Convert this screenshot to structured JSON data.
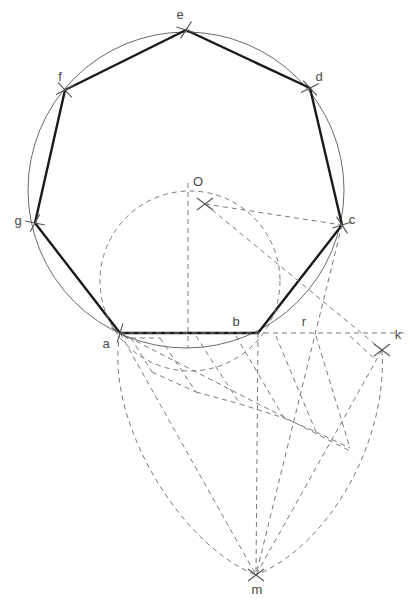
{
  "figure": {
    "background_color": "#ffffff",
    "colors": {
      "polygon_stroke": "#1a1a1a",
      "circle_stroke": "#6b6b6b",
      "construction_stroke": "#7a7a7a",
      "tick_stroke": "#555555",
      "label_fill": "#4a4a4a"
    }
  },
  "labels": [
    {
      "id": "label-a",
      "text": "a",
      "x": 106,
      "y": 345
    },
    {
      "id": "label-b",
      "text": "b",
      "x": 236,
      "y": 323
    },
    {
      "id": "label-c",
      "text": "c",
      "x": 352,
      "y": 221
    },
    {
      "id": "label-d",
      "text": "d",
      "x": 319,
      "y": 78
    },
    {
      "id": "label-e",
      "text": "e",
      "x": 180,
      "y": 16
    },
    {
      "id": "label-f",
      "text": "f",
      "x": 60,
      "y": 78
    },
    {
      "id": "label-g",
      "text": "g",
      "x": 18,
      "y": 222
    },
    {
      "id": "label-O",
      "text": "O",
      "x": 198,
      "y": 183
    },
    {
      "id": "label-r",
      "text": "r",
      "x": 304,
      "y": 323
    },
    {
      "id": "label-k",
      "text": "k",
      "x": 398,
      "y": 336
    },
    {
      "id": "label-m",
      "text": "m",
      "x": 257,
      "y": 591
    }
  ],
  "points": {
    "a": {
      "x": 120,
      "y": 333
    },
    "b": {
      "x": 258,
      "y": 333
    },
    "c": {
      "x": 342,
      "y": 225
    },
    "d": {
      "x": 310,
      "y": 88
    },
    "e": {
      "x": 186,
      "y": 30
    },
    "f": {
      "x": 65,
      "y": 90
    },
    "g": {
      "x": 35,
      "y": 223
    },
    "O": {
      "x": 205,
      "y": 204
    },
    "k": {
      "x": 382,
      "y": 335
    },
    "m": {
      "x": 256,
      "y": 575
    }
  },
  "circles": {
    "circumcircle": {
      "cx": 186,
      "cy": 190,
      "r": 158
    },
    "construction_circle": {
      "cx": 190,
      "cy": 281,
      "r": 90
    }
  },
  "polygon_path": "M120,333 L258,333 L342,225 L310,88 L186,30 L65,90 L35,223 Z",
  "tick_marks": [
    {
      "id": "tick-a",
      "x": 120,
      "y": 333,
      "angle": 70
    },
    {
      "id": "tick-c",
      "x": 342,
      "y": 225,
      "angle": 20
    },
    {
      "id": "tick-d",
      "x": 310,
      "y": 88,
      "angle": 10
    },
    {
      "id": "tick-e",
      "x": 186,
      "y": 30,
      "angle": -20
    },
    {
      "id": "tick-f",
      "x": 65,
      "y": 90,
      "angle": 10
    },
    {
      "id": "tick-g",
      "x": 35,
      "y": 223,
      "angle": -25
    },
    {
      "id": "tick-O",
      "x": 205,
      "y": 204,
      "angle": 0
    },
    {
      "id": "tick-k",
      "x": 382,
      "y": 350,
      "angle": 0
    },
    {
      "id": "tick-m",
      "x": 256,
      "y": 575,
      "angle": 0
    }
  ],
  "construction": {
    "description": "Dashed auxiliary construction: vertical axis through O, chords from O and from a/b to k and m, a family of parallel transversals stepping the division of segment a-k into equal parts, and two large arcs meeting at m.",
    "vertical_axis": {
      "x1": 188,
      "y1": 183,
      "x2": 188,
      "y2": 348
    },
    "baseline_ak": {
      "x1": 120,
      "y1": 333,
      "x2": 404,
      "y2": 333
    },
    "rays_from_O": [
      {
        "x1": 205,
        "y1": 204,
        "x2": 342,
        "y2": 225
      },
      {
        "x1": 205,
        "y1": 204,
        "x2": 382,
        "y2": 350
      }
    ],
    "rays_to_m": [
      {
        "x1": 120,
        "y1": 333,
        "x2": 256,
        "y2": 575
      },
      {
        "x1": 258,
        "y1": 333,
        "x2": 256,
        "y2": 575
      },
      {
        "x1": 342,
        "y1": 225,
        "x2": 256,
        "y2": 575
      },
      {
        "x1": 382,
        "y1": 350,
        "x2": 256,
        "y2": 575
      }
    ],
    "teardrop_arcs": [
      {
        "d": "M120,333 C104,420 180,545 256,575"
      },
      {
        "d": "M382,350 C388,440 330,545 256,575"
      }
    ],
    "oblique_guide": {
      "x1": 120,
      "y1": 333,
      "x2": 352,
      "y2": 452
    },
    "transversals": [
      {
        "x1": 131,
        "y1": 338,
        "x2": 152,
        "y2": 372
      },
      {
        "x1": 160,
        "y1": 338,
        "x2": 196,
        "y2": 392
      },
      {
        "x1": 196,
        "y1": 336,
        "x2": 240,
        "y2": 404
      },
      {
        "x1": 236,
        "y1": 336,
        "x2": 284,
        "y2": 418
      },
      {
        "x1": 276,
        "y1": 336,
        "x2": 316,
        "y2": 432
      },
      {
        "x1": 316,
        "y1": 336,
        "x2": 350,
        "y2": 448
      },
      {
        "x1": 350,
        "y1": 336,
        "x2": 376,
        "y2": 360
      }
    ],
    "step_connectors": [
      {
        "x1": 131,
        "y1": 338,
        "x2": 160,
        "y2": 338
      },
      {
        "x1": 152,
        "y1": 372,
        "x2": 196,
        "y2": 392
      },
      {
        "x1": 196,
        "y1": 392,
        "x2": 240,
        "y2": 404
      },
      {
        "x1": 240,
        "y1": 404,
        "x2": 284,
        "y2": 418
      },
      {
        "x1": 284,
        "y1": 418,
        "x2": 316,
        "y2": 432
      },
      {
        "x1": 316,
        "y1": 432,
        "x2": 350,
        "y2": 448
      }
    ]
  }
}
